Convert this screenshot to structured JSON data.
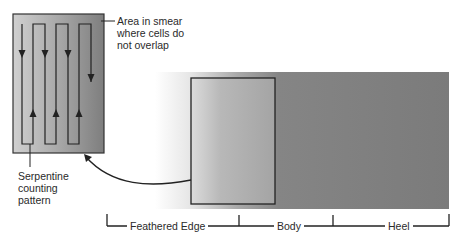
{
  "figure": {
    "callouts": {
      "area_line1": "Area in smear",
      "area_line2": "where cells do",
      "area_line3": "not overlap",
      "pattern_line1": "Serpentine",
      "pattern_line2": "counting",
      "pattern_line3": "pattern"
    },
    "regions": [
      {
        "label": "Feathered Edge"
      },
      {
        "label": "Body"
      },
      {
        "label": "Heel"
      }
    ],
    "colors": {
      "smear_dark": "#7a7a7a",
      "smear_light": "#ffffff",
      "inset_light": "#c4c4c4",
      "inset_dark": "#7e7e7e",
      "line": "#222222",
      "text": "#2a2a2a"
    }
  }
}
